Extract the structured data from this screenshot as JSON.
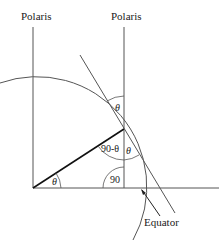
{
  "diagram": {
    "type": "geometry",
    "labels": {
      "polaris_left": "Polaris",
      "polaris_right": "Polaris",
      "equator": "Equator"
    },
    "angles": {
      "theta_center": "θ",
      "theta_top": "θ",
      "theta_lower": "θ",
      "ninety_minus_theta": "90-θ",
      "right_angle": "90"
    },
    "colors": {
      "line": "#555555",
      "bold_line": "#111111",
      "text": "#1a1a1a",
      "background": "#ffffff"
    }
  }
}
